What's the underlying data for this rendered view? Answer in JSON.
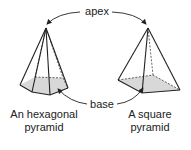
{
  "labels": {
    "apex": "apex",
    "base": "base",
    "hex_line1": "An hexagonal",
    "hex_line2": "pyramid",
    "sq_line1": "A square",
    "sq_line2": "pyramid"
  },
  "colors": {
    "line": "#222222",
    "base_fill": "#d8d8d8"
  }
}
